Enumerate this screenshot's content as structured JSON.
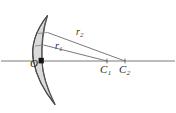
{
  "figure": {
    "kind": "optics-ray-diagram",
    "background_color": "#ffffff",
    "stroke_color": "#4a4a4a",
    "axis_color": "#6e6e6e",
    "fill_color": "#d9d9d9",
    "marker_color": "#1a1a1a",
    "labels": {
      "vertex": "O",
      "center1_base": "C",
      "center1_sub": "1",
      "center2_base": "C",
      "center2_sub": "2",
      "radius1_base": "r",
      "radius1_sub": "1",
      "radius2_base": "r",
      "radius2_sub": "2"
    },
    "geometry": {
      "axis_y": 61,
      "axis_x_start": 0,
      "axis_x_end": 176,
      "vertex_point": [
        42,
        61
      ],
      "center1_point": [
        107,
        61
      ],
      "center2_point": [
        125,
        61
      ],
      "radius1_upper_point": [
        44,
        45
      ],
      "radius2_upper_point": [
        48,
        33
      ],
      "lens_front_top": [
        48,
        16
      ],
      "lens_front_bottom": [
        55,
        104
      ],
      "lens_back_top": [
        44,
        17
      ],
      "lens_back_bottom": [
        51,
        103
      ]
    }
  }
}
